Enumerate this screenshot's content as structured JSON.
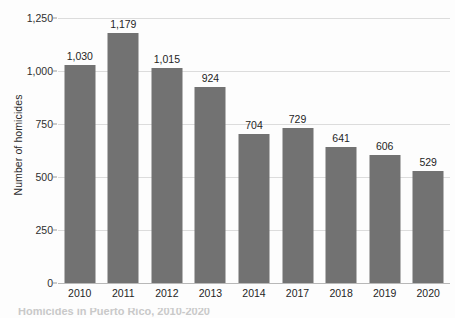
{
  "chart_data": {
    "type": "bar",
    "title": "",
    "xlabel": "",
    "ylabel": "Number of homicides",
    "categories": [
      "2010",
      "2011",
      "2012",
      "2013",
      "2014",
      "2017",
      "2018",
      "2019",
      "2020"
    ],
    "values": [
      1030,
      1179,
      1015,
      924,
      704,
      729,
      641,
      606,
      529
    ],
    "value_labels": [
      "1,030",
      "1,179",
      "1,015",
      "924",
      "704",
      "729",
      "641",
      "606",
      "529"
    ],
    "ylim": [
      0,
      1250
    ],
    "ytick_values": [
      0,
      250,
      500,
      750,
      1000,
      1250
    ],
    "ytick_labels": [
      "0",
      "250",
      "500",
      "750",
      "1,000",
      "1,250"
    ],
    "grid": true,
    "legend": "none",
    "series": [
      {
        "name": "Number of homicides",
        "color": "#727272",
        "values": [
          1030,
          1179,
          1015,
          924,
          704,
          729,
          641,
          606,
          529
        ]
      }
    ]
  },
  "caption": {
    "text": "Homicides in Puerto Rico, 2010-2020"
  },
  "colors": {
    "bar": "#727272",
    "gridline": "#dcdcdc",
    "baseline": "#b8b8b8",
    "text": "#1f1f1f",
    "background": "#fdfdfd"
  }
}
